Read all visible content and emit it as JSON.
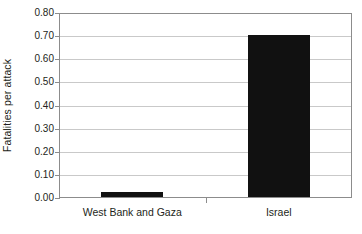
{
  "chart_data": {
    "type": "bar",
    "title": "",
    "subtitle": "",
    "xlabel": "",
    "ylabel": "Fatalities per attack",
    "categories": [
      "West Bank and Gaza",
      "Israel"
    ],
    "values": [
      0.02,
      0.7
    ],
    "series": [
      {
        "name": "Fatalities per attack",
        "values": [
          0.02,
          0.7
        ]
      }
    ],
    "ylim": [
      0.0,
      0.8
    ],
    "ytick_step": 0.1,
    "ytick_labels": [
      "0.00",
      "0.10",
      "0.20",
      "0.30",
      "0.40",
      "0.50",
      "0.60",
      "0.70",
      "0.80"
    ],
    "ytick_values": [
      0.0,
      0.1,
      0.2,
      0.3,
      0.4,
      0.5,
      0.6,
      0.7,
      0.8
    ],
    "grid": "horizontal",
    "legend": "none",
    "bar_color": "#111111",
    "gridline_color": "#c9c9c9",
    "axis_color": "#8c8c8c",
    "background_color": "#ffffff",
    "annotations": []
  }
}
